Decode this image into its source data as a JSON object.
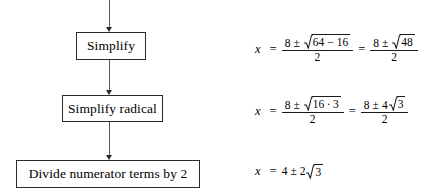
{
  "diagram": {
    "type": "flowchart-with-equations",
    "flow_steps": [
      {
        "id": "simplify",
        "label": "Simplify"
      },
      {
        "id": "simplify-radical",
        "label": "Simplify radical"
      },
      {
        "id": "divide",
        "label": "Divide numerator terms by 2"
      }
    ],
    "connectors": [
      {
        "id": "arrow-into-simplify",
        "from": "above",
        "to": "simplify",
        "style": "arrow-down"
      },
      {
        "id": "arrow-simplify-to-radical",
        "from": "simplify",
        "to": "simplify-radical",
        "style": "arrow-down"
      },
      {
        "id": "arrow-radical-to-divide",
        "from": "simplify-radical",
        "to": "divide",
        "style": "arrow-down"
      }
    ],
    "equations": [
      {
        "id": "equation-1",
        "text": "x = (8 ± √(64 − 16)) / 2 = (8 ± √48) / 2",
        "variable": "x",
        "equals": "=",
        "left": {
          "numerator": {
            "lead": "8",
            "pm": "±",
            "radicand": {
              "a": "64",
              "op": "−",
              "b": "16"
            }
          },
          "denominator": "2"
        },
        "right": {
          "numerator": {
            "lead": "8",
            "pm": "±",
            "radicand": {
              "a": "48"
            }
          },
          "denominator": "2"
        }
      },
      {
        "id": "equation-2",
        "text": "x = (8 ± √(16 · 3)) / 2 = (8 ± 4√3) / 2",
        "variable": "x",
        "equals": "=",
        "left": {
          "numerator": {
            "lead": "8",
            "pm": "±",
            "radicand": {
              "a": "16",
              "op": "·",
              "b": "3"
            }
          },
          "denominator": "2"
        },
        "right": {
          "numerator": {
            "lead": "8",
            "pm": "±",
            "coefficient": "4",
            "radicand": {
              "a": "3"
            }
          },
          "denominator": "2"
        }
      },
      {
        "id": "equation-3",
        "text": "x = 4 ± 2√3",
        "variable": "x",
        "equals": "=",
        "lead": "4",
        "pm": "±",
        "coefficient": "2",
        "radicand": {
          "a": "3"
        }
      }
    ]
  },
  "colors": {
    "background": "#ffffff",
    "box_border": "#2b2b2b",
    "text": "#000000",
    "connector": "#555a5f"
  }
}
